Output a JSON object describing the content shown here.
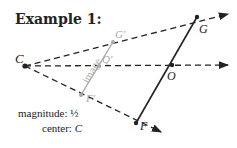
{
  "title": "Example 1:",
  "points": {
    "C": {
      "label": "C",
      "x": 25,
      "y": 66
    },
    "G": {
      "label": "G",
      "x": 197,
      "y": 17
    },
    "O": {
      "label": "O",
      "x": 172,
      "y": 65
    },
    "F": {
      "label": "F",
      "x": 136,
      "y": 123
    },
    "G_prime": {
      "label": "G′",
      "x": 113,
      "y": 42
    },
    "Q_prime": {
      "label": "Q′",
      "x": 99,
      "y": 66
    },
    "F_prime": {
      "label": "F′",
      "x": 81,
      "y": 95
    }
  },
  "image_label": "image",
  "magnitude_label": "magnitude:",
  "magnitude_value": "½",
  "center_label": "center:",
  "center_value": "C",
  "colors": {
    "ink": "#222222",
    "image": "#aaaaaa"
  }
}
